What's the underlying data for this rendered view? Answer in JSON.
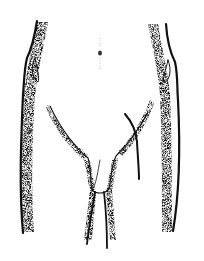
{
  "illustration": {
    "subject": "anterior lower torso line drawing with incision line",
    "colors": {
      "background": "#ffffff",
      "ink": "#111111",
      "stipple": "#555555"
    }
  }
}
